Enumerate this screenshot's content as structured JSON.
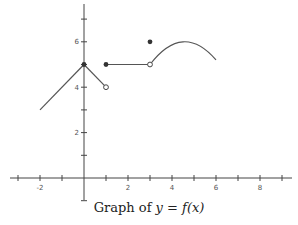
{
  "chart_data": {
    "type": "line",
    "title": "Graph of y = f(x)",
    "xlabel": "x",
    "ylabel": "y",
    "xlim": [
      -3,
      9
    ],
    "ylim": [
      -1,
      7
    ],
    "x_tick_labels": [
      "-2",
      "2",
      "4",
      "6",
      "8"
    ],
    "y_tick_labels": [
      "2",
      "4",
      "6"
    ],
    "grid": false,
    "segments": [
      {
        "kind": "line",
        "points": [
          [
            -2,
            3
          ],
          [
            0,
            5
          ]
        ]
      },
      {
        "kind": "line",
        "points": [
          [
            0,
            5
          ],
          [
            1,
            4
          ]
        ],
        "end": "open"
      },
      {
        "kind": "line",
        "points": [
          [
            1,
            5
          ],
          [
            3,
            5
          ]
        ],
        "start": "closed",
        "end": "open"
      },
      {
        "kind": "curve",
        "points": [
          [
            3,
            5
          ],
          [
            4.5,
            6
          ],
          [
            6,
            5.2
          ]
        ],
        "start": "open"
      }
    ],
    "isolated_points": [
      [
        3,
        6
      ]
    ],
    "closed_points": [
      [
        0,
        5
      ],
      [
        1,
        5
      ],
      [
        3,
        6
      ]
    ],
    "open_points": [
      [
        1,
        4
      ],
      [
        3,
        5
      ]
    ]
  },
  "caption": {
    "prefix": "Graph of ",
    "expr": "y = f(x)"
  }
}
